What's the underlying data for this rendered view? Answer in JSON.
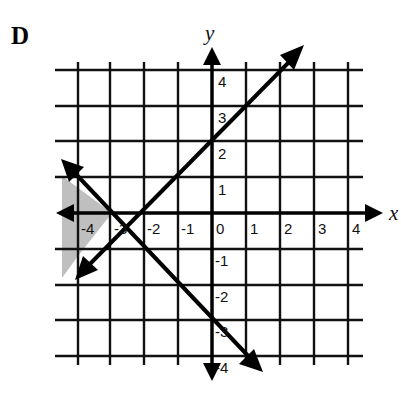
{
  "panel_label": "D",
  "graph": {
    "x_axis_label": "x",
    "y_axis_label": "y",
    "x_ticks": [
      "-4",
      "-3",
      "-2",
      "-1",
      "0",
      "1",
      "2",
      "3",
      "4"
    ],
    "y_ticks": [
      "4",
      "3",
      "2",
      "1",
      "-1",
      "-2",
      "-3",
      "-4"
    ],
    "grid_range": {
      "x": [
        -4,
        4
      ],
      "y": [
        -4,
        4
      ]
    },
    "lines": [
      {
        "name": "increasing-line",
        "points": [
          [
            -4,
            -1.6
          ],
          [
            2.6,
            4.6
          ]
        ],
        "y_intercept": 2.3,
        "x_intercept": -3
      },
      {
        "name": "decreasing-line",
        "points": [
          [
            -4.4,
            1.4
          ],
          [
            1.5,
            -4.4
          ]
        ],
        "y_intercept": -3,
        "x_intercept": -3.3
      }
    ],
    "shaded_region": "left of both lines, approximately x < -3.3, between the two lines",
    "shade_color": "#b8b8b8"
  }
}
